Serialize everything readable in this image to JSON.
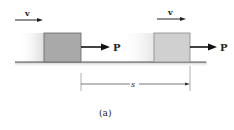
{
  "figure": {
    "caption": "(a)",
    "velocity_label_1": "v",
    "velocity_label_2": "v",
    "force_label_1": "P",
    "force_label_2": "P",
    "displacement_label": "s"
  },
  "colors": {
    "block_1": "#a9a9a9",
    "block_2": "#cfcfcf",
    "floor": "#555555",
    "arrow": "#111111"
  }
}
